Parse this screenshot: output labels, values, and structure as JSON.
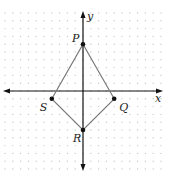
{
  "figure": {
    "type": "coordinate-grid",
    "axes": {
      "x_label": "x",
      "y_label": "y"
    },
    "grid": {
      "style": "dotted",
      "unit_px": 7.8,
      "origin_px": [
        83,
        91
      ]
    },
    "colors": {
      "axes": "#111111",
      "polygon": "#777777",
      "points": "#111111",
      "grid_dots": "#c8c8c8"
    },
    "points": [
      {
        "label": "P",
        "x": 0,
        "y": 6
      },
      {
        "label": "Q",
        "x": 4,
        "y": -1
      },
      {
        "label": "R",
        "x": 0,
        "y": -5
      },
      {
        "label": "S",
        "x": -4,
        "y": -1
      }
    ],
    "polygon": [
      "P",
      "Q",
      "R",
      "S"
    ]
  }
}
